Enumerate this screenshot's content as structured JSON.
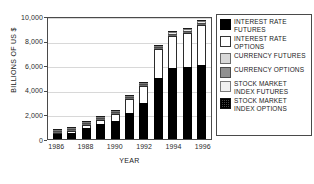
{
  "chart_data": {
    "type": "bar",
    "title": "",
    "subtitle": "",
    "xlabel": "YEAR",
    "ylabel": "BILLIONS OF US $",
    "ylim": [
      0,
      10000
    ],
    "grid": true,
    "stacked": true,
    "legend_position": "right",
    "categories": [
      "1986",
      "1987",
      "1988",
      "1989",
      "1990",
      "1991",
      "1992",
      "1993",
      "1994",
      "1995",
      "1996"
    ],
    "xtick_labels": [
      "1986",
      "1988",
      "1990",
      "1992",
      "1994",
      "1996"
    ],
    "ytick_labels": [
      "0",
      "2,000",
      "4,000",
      "6,000",
      "8,000",
      "10,000"
    ],
    "ytick_values": [
      0,
      2000,
      4000,
      6000,
      8000,
      10000
    ],
    "series": [
      {
        "name": "INTEREST RATE FUTURES",
        "color": "#000000",
        "values": [
          370,
          490,
          895,
          1200,
          1455,
          2155,
          2915,
          4960,
          5780,
          5860,
          5980
        ]
      },
      {
        "name": "INTEREST RATE OPTIONS",
        "color": "#ffffff",
        "values": [
          145,
          150,
          280,
          385,
          600,
          1070,
          1385,
          2360,
          2625,
          2740,
          3280
        ]
      },
      {
        "name": "CURRENCY FUTURES",
        "color": "#d2d2d2",
        "values": [
          10,
          15,
          12,
          16,
          17,
          18,
          25,
          30,
          33,
          38,
          50
        ]
      },
      {
        "name": "CURRENCY OPTIONS",
        "color": "#8f8f8f",
        "values": [
          39,
          50,
          48,
          50,
          56,
          61,
          80,
          81,
          55,
          43,
          47
        ]
      },
      {
        "name": "STOCK MARKET INDEX FUTURES",
        "color": "#ededed",
        "values": [
          15,
          18,
          28,
          42,
          70,
          77,
          80,
          110,
          128,
          172,
          199
        ]
      },
      {
        "name": "STOCK MARKET INDEX OPTIONS",
        "color": "#3a3a3a",
        "values": [
          4,
          6,
          8,
          10,
          12,
          19,
          24,
          38,
          45,
          55,
          65
        ]
      }
    ],
    "totals": [
      583,
      729,
      1271,
      1703,
      2210,
      3400,
      4509,
      7579,
      8666,
      8908,
      9621
    ]
  },
  "axes": {
    "y_title": "BILLIONS OF US $",
    "x_title": "YEAR"
  },
  "legend": {
    "items": [
      {
        "label": "INTEREST RATE\nFUTURES",
        "swatch": "irf"
      },
      {
        "label": "INTEREST RATE\nOPTIONS",
        "swatch": "iro"
      },
      {
        "label": "CURRENCY FUTURES",
        "swatch": "cf"
      },
      {
        "label": "CURRENCY OPTIONS",
        "swatch": "co"
      },
      {
        "label": "STOCK MARKET\nINDEX FUTURES",
        "swatch": "smif"
      },
      {
        "label": "STOCK MARKET\nINDEX OPTIONS",
        "swatch": "smio"
      }
    ]
  }
}
